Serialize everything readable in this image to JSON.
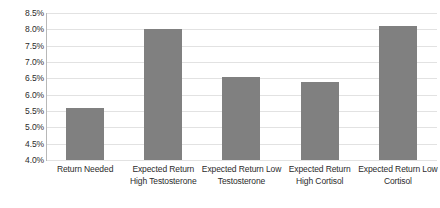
{
  "chart_data": {
    "type": "bar",
    "title": "",
    "xlabel": "",
    "ylabel": "",
    "ylim": [
      4.0,
      8.5
    ],
    "grid": true,
    "legend": false,
    "categories": [
      "Return Needed",
      "Expected Return High Testosterone",
      "Expected Return Low Testosterone",
      "Expected Return High Cortisol",
      "Expected Return Low Cortisol"
    ],
    "category_lines": [
      [
        "Return Needed"
      ],
      [
        "Expected Return",
        "High Testosterone"
      ],
      [
        "Expected Return Low",
        "Testosterone"
      ],
      [
        "Expected Return",
        "High Cortisol"
      ],
      [
        "Expected Return Low",
        "Cortisol"
      ]
    ],
    "values": [
      5.6,
      8.0,
      6.55,
      6.4,
      8.1
    ],
    "value_labels": [
      "5.6%",
      "8.0%",
      "6.55%",
      "6.4%",
      "8.1%"
    ],
    "ytick_labels": [
      "8.5%",
      "8.0%",
      "7.5%",
      "7.0%",
      "6.5%",
      "6.0%",
      "5.5%",
      "5.0%",
      "4.5%",
      "4.0%"
    ],
    "ytick_values": [
      8.5,
      8.0,
      7.5,
      7.0,
      6.5,
      6.0,
      5.5,
      5.0,
      4.5,
      4.0
    ],
    "colors": {
      "bar": "#808080",
      "gridline": "#e2e2e2",
      "axis": "#b8b8b8",
      "text": "#2b2b2b",
      "background": "#ffffff"
    }
  }
}
